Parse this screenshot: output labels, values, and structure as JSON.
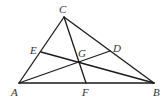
{
  "diagram": {
    "stroke_color": "#1a1a1a",
    "label_color": "#333333",
    "points": {
      "A": {
        "label": "A",
        "x": 19,
        "y": 83,
        "lx": 11,
        "ly": 96
      },
      "B": {
        "label": "B",
        "x": 154,
        "y": 83,
        "lx": 153,
        "ly": 96
      },
      "C": {
        "label": "C",
        "x": 64,
        "y": 17,
        "lx": 59,
        "ly": 13
      },
      "D": {
        "label": "D",
        "x": 110,
        "y": 51,
        "lx": 113,
        "ly": 52
      },
      "E": {
        "label": "E",
        "x": 41,
        "y": 52,
        "lx": 30,
        "ly": 54
      },
      "F": {
        "label": "F",
        "x": 86,
        "y": 83,
        "lx": 82,
        "ly": 96
      },
      "G": {
        "label": "G",
        "x": 78,
        "y": 62,
        "lx": 78,
        "ly": 57
      }
    },
    "segments": [
      {
        "name": "side-ab",
        "from": "A",
        "to": "B"
      },
      {
        "name": "side-bc",
        "from": "B",
        "to": "C"
      },
      {
        "name": "side-ca",
        "from": "C",
        "to": "A"
      },
      {
        "name": "cevian-ad",
        "from": "A",
        "to": "D"
      },
      {
        "name": "cevian-be",
        "from": "B",
        "to": "E"
      },
      {
        "name": "cevian-cf",
        "from": "C",
        "to": "F"
      }
    ]
  }
}
